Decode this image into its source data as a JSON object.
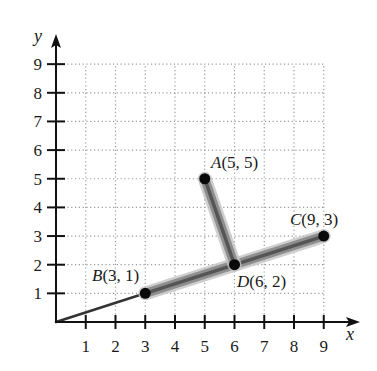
{
  "chart_data": {
    "type": "scatter",
    "title": "",
    "xlabel": "x",
    "ylabel": "y",
    "xlim": [
      0,
      9
    ],
    "ylim": [
      0,
      9
    ],
    "grid": "dotted",
    "x_ticks": [
      "1",
      "2",
      "3",
      "4",
      "5",
      "6",
      "7",
      "8",
      "9"
    ],
    "y_ticks": [
      "1",
      "2",
      "3",
      "4",
      "5",
      "6",
      "7",
      "8",
      "9"
    ],
    "points": [
      {
        "name": "A",
        "x": 5,
        "y": 5,
        "label": "A(5, 5)"
      },
      {
        "name": "B",
        "x": 3,
        "y": 1,
        "label": "B(3, 1)"
      },
      {
        "name": "C",
        "x": 9,
        "y": 3,
        "label": "C(9, 3)"
      },
      {
        "name": "D",
        "x": 6,
        "y": 2,
        "label": "D(6, 2)"
      }
    ],
    "segments": [
      {
        "from": [
          0,
          0
        ],
        "to": [
          3,
          1
        ],
        "style": "thin"
      },
      {
        "from": [
          3,
          1
        ],
        "to": [
          9,
          3
        ],
        "style": "thick-shaded"
      },
      {
        "from": [
          5,
          5
        ],
        "to": [
          6,
          2
        ],
        "style": "thick-shaded"
      }
    ]
  },
  "colors": {
    "axis": "#111111",
    "grid": "#9a9a9a",
    "band_outer": "#c4c4c4",
    "band_mid": "#8e8e8e",
    "band_core": "#555555",
    "point": "#0a0a0a"
  },
  "layout": {
    "origin_px": [
      56,
      322
    ],
    "unit_x": 29.75,
    "unit_y": 28.65
  }
}
